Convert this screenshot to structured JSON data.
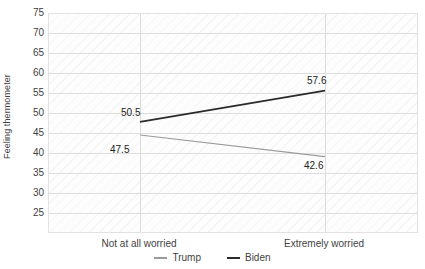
{
  "chart_data": {
    "type": "line",
    "title": "",
    "subtitle": "",
    "xlabel": "",
    "ylabel": "Feeling thermometer",
    "categories": [
      "Not at all worried",
      "Extremely worried"
    ],
    "series": [
      {
        "name": "Trump",
        "color": "#9a9a9a",
        "values": [
          47.5,
          42.6
        ],
        "labels": [
          "47.5",
          "42.6"
        ]
      },
      {
        "name": "Biden",
        "color": "#2b2b2b",
        "values": [
          50.5,
          57.6
        ],
        "labels": [
          "50.5",
          "57.6"
        ]
      }
    ],
    "ylim": [
      25,
      75
    ],
    "yticks": [
      75,
      70,
      65,
      60,
      55,
      50,
      45,
      40,
      35,
      30,
      25
    ],
    "ytick_labels": [
      "75",
      "70",
      "65",
      "60",
      "55",
      "50",
      "45",
      "40",
      "35",
      "30",
      "25"
    ],
    "grid": {
      "horizontal": true,
      "vertical": true,
      "color": "#dedede"
    },
    "legend": {
      "position": "bottom",
      "orientation": "horizontal",
      "entries": [
        {
          "label": "Trump",
          "color": "#9a9a9a"
        },
        {
          "label": "Biden",
          "color": "#2b2b2b"
        }
      ]
    },
    "plot_background": "#fdfdfd",
    "plot_pattern": "diagonal-hatch"
  }
}
